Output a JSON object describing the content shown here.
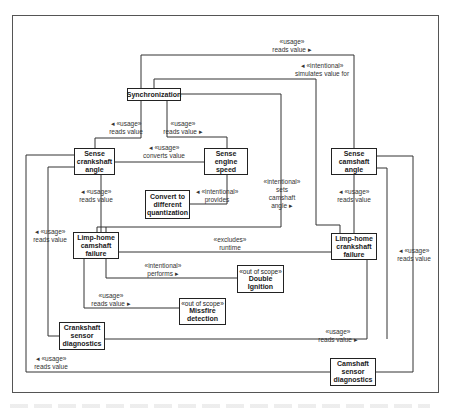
{
  "diagram": {
    "type": "UML feature dependency diagram",
    "nodes": {
      "synchronization": {
        "name": "Synchronization"
      },
      "sense_crankshaft_angle": {
        "name": "Sense\ncrankshaft\nangle"
      },
      "sense_engine_speed": {
        "name": "Sense\nengine\nspeed"
      },
      "convert_quantization": {
        "name": "Convert to\ndifferent\nquantization"
      },
      "sense_camshaft_angle": {
        "name": "Sense\ncamshaft\nangle"
      },
      "limp_home_camshaft": {
        "name": "Limp-home\ncamshaft\nfailure"
      },
      "limp_home_crankshaft": {
        "name": "Limp-home\ncrankshaft\nfailure"
      },
      "double_ignition": {
        "stereotype": "«out of scope»",
        "name": "Double\nIgnition"
      },
      "missfire_detection": {
        "stereotype": "«out of scope»",
        "name": "Missfire\ndetection"
      },
      "crankshaft_diag": {
        "name": "Crankshaft\nsensor\ndiagnostics"
      },
      "camshaft_diag": {
        "name": "Camshaft\nsensor\ndiagnostics"
      }
    },
    "edges": [
      {
        "id": "e1",
        "label": "«usage»\nreads value ▸",
        "from": "Synchronization",
        "to": "Sense camshaft angle"
      },
      {
        "id": "e2",
        "label": "◂  «intentional»\nsimulates value for",
        "from": "Limp-home crankshaft failure",
        "to": "Synchronization"
      },
      {
        "id": "e3",
        "label": "◂  «usage»\nreads value",
        "from": "Synchronization",
        "to": "Sense crankshaft angle"
      },
      {
        "id": "e4",
        "label": "«usage»\nreads value ▸",
        "from": "Synchronization",
        "to": "Sense engine speed"
      },
      {
        "id": "e5",
        "label": "◂  «usage»\nconverts value",
        "from": "Sense engine speed",
        "to": "Sense crankshaft angle"
      },
      {
        "id": "e6",
        "label": "«intentional»\nsets\ncamshaft\nangle ▸",
        "from": "Limp-home camshaft failure",
        "to": "Synchronization"
      },
      {
        "id": "e7",
        "label": "◂  «intentional»\nprovides",
        "from": "Sense engine speed",
        "to": "Convert to different quantization"
      },
      {
        "id": "e8",
        "label": "◂  «usage»\nreads value",
        "from": "Limp-home camshaft failure",
        "to": "Sense crankshaft angle"
      },
      {
        "id": "e9",
        "label": "◂  «usage»\nreads value",
        "from": "Limp-home crankshaft failure",
        "to": "Sense camshaft angle"
      },
      {
        "id": "e10",
        "label": "«excludes»\nruntime",
        "from": "Limp-home camshaft failure",
        "to": "Limp-home crankshaft failure"
      },
      {
        "id": "e11",
        "label": "«intentional»\nperforms ▸",
        "from": "Limp-home camshaft failure",
        "to": "Double Ignition"
      },
      {
        "id": "e12",
        "label": "«usage»\nreads value ▸",
        "from": "Limp-home camshaft failure",
        "to": "Missfire detection"
      },
      {
        "id": "e13",
        "label": "◂  «usage»\nreads value",
        "from": "Crankshaft sensor diagnostics",
        "to": "Sense crankshaft angle"
      },
      {
        "id": "e14",
        "label": "«usage»\nreads value ▸",
        "from": "Crankshaft sensor diagnostics",
        "to": "Limp-home crankshaft failure"
      },
      {
        "id": "e15",
        "label": "◂  «usage»\nreads value",
        "from": "Camshaft sensor diagnostics",
        "to": "Sense crankshaft angle"
      },
      {
        "id": "e16",
        "label": "◂  «usage»\nreads value",
        "from": "Camshaft sensor diagnostics",
        "to": "Sense camshaft angle"
      }
    ]
  }
}
